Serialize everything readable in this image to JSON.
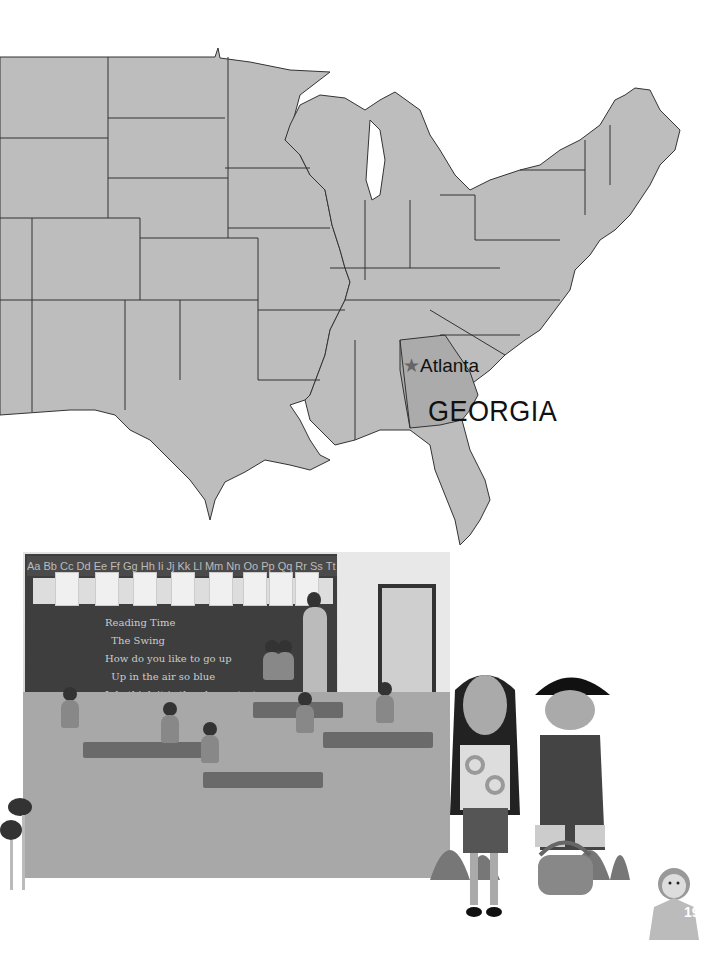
{
  "map": {
    "city_label": "Atlanta",
    "city_marker": "★",
    "state_label": "GEORGIA",
    "fill_color": "#bdbdbd",
    "highlight_fill": "#ababab",
    "border_color": "#333333"
  },
  "photo": {
    "alphabet_strip": "Aa Bb Cc Dd Ee Ff Gg Hh Ii Jj Kk Ll Mm Nn Oo Pp Qq Rr Ss Tt",
    "board_lines": "Reading Time\n  The Swing\nHow do you like to go up\n  Up in the air so blue\nI do think it is the pleasantest",
    "poster": "READ AND REMEMBER"
  },
  "page": {
    "number": "19"
  }
}
